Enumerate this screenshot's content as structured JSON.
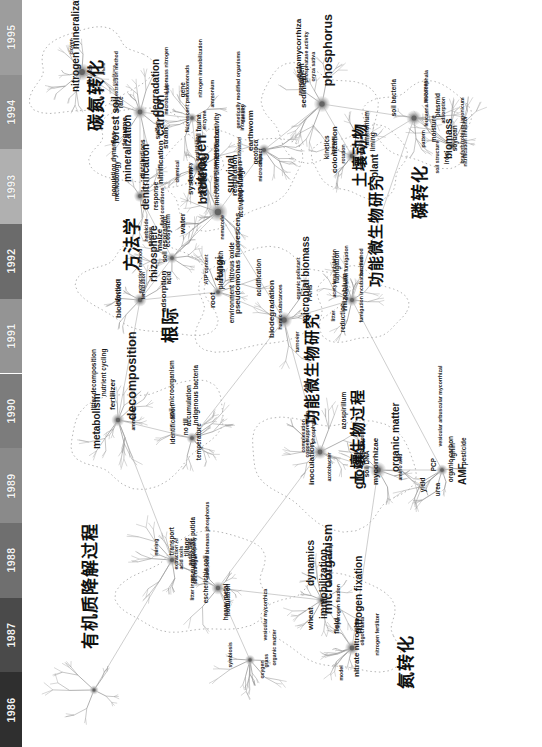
{
  "figure": {
    "type": "co-word-science-map",
    "orientation_deg": -90,
    "background": "#ffffff",
    "edge_color": "#8c8c8c",
    "cluster_outline_color": "#b9b9b9",
    "node_color": "#9a9a9a"
  },
  "timeline": {
    "name": "year-axis",
    "position": "left-edge-vertical",
    "order": "bottom-to-top",
    "years": [
      {
        "label": "1986",
        "shade": "#2f2f2f"
      },
      {
        "label": "1987",
        "shade": "#4a4a4a"
      },
      {
        "label": "1988",
        "shade": "#6f6f6f"
      },
      {
        "label": "1989",
        "shade": "#8a8a8a"
      },
      {
        "label": "1990",
        "shade": "#7c7c7c"
      },
      {
        "label": "1991",
        "shade": "#949494"
      },
      {
        "label": "1992",
        "shade": "#6b6b6b"
      },
      {
        "label": "1993",
        "shade": "#b0b0b0"
      },
      {
        "label": "1994",
        "shade": "#8f8f8f"
      },
      {
        "label": "1995",
        "shade": "#9d9d9d"
      }
    ]
  },
  "clusters": [
    {
      "id": "c-cn",
      "cjk": "碳氮转化",
      "meaning": "carbon-nitrogen transformation"
    },
    {
      "id": "c-meth",
      "cjk": "方法学",
      "meaning": "methodology"
    },
    {
      "id": "c-root",
      "cjk": "根际",
      "meaning": "rhizosphere"
    },
    {
      "id": "c-fauna",
      "cjk": "土壤动物",
      "meaning": "soil fauna"
    },
    {
      "id": "c-p",
      "cjk": "磷转化",
      "meaning": "phosphorus transformation"
    },
    {
      "id": "c-func",
      "cjk": "功能微生物研究",
      "meaning": "functional microorganism research"
    },
    {
      "id": "c-om",
      "cjk": "有机质降解过程",
      "meaning": "organic matter degradation process"
    },
    {
      "id": "c-func2",
      "cjk": "功能微生物研究",
      "meaning": "functional microorganism research"
    },
    {
      "id": "c-sbio",
      "cjk": "土壤生物过程",
      "meaning": "soil biological process"
    },
    {
      "id": "c-n",
      "cjk": "氮转化",
      "meaning": "nitrogen transformation"
    }
  ],
  "keywords": [
    {
      "t": "pH",
      "s": 4
    },
    {
      "t": "nitrogen mineralization",
      "s": 5
    },
    {
      "t": "alfalfa",
      "s": 1
    },
    {
      "t": "ace",
      "s": 2
    },
    {
      "t": "clover",
      "s": 2
    },
    {
      "t": "carbon",
      "s": 6
    },
    {
      "t": "conditions",
      "s": 1
    },
    {
      "t": "legume",
      "s": 4
    },
    {
      "t": "rate",
      "s": 3
    },
    {
      "t": "forest soil",
      "s": 5
    },
    {
      "t": "sulfur",
      "s": 3
    },
    {
      "t": "degradation",
      "s": 5
    },
    {
      "t": "direct extraction method",
      "s": 2
    },
    {
      "t": "soil",
      "s": 2
    },
    {
      "t": "gene",
      "s": 3
    },
    {
      "t": "strain",
      "s": 4
    },
    {
      "t": "enzyme",
      "s": 2
    },
    {
      "t": "microbial biomass nitrogen",
      "s": 2
    },
    {
      "t": "ammonium",
      "s": 2
    },
    {
      "t": "fluorescent pseudomonads",
      "s": 2
    },
    {
      "t": "nitrogen immobilization",
      "s": 2
    },
    {
      "t": "methodology",
      "s": 3
    },
    {
      "t": "denitrification",
      "s": 5
    },
    {
      "t": "population dynamics",
      "s": 3
    },
    {
      "t": "field conditions",
      "s": 2
    },
    {
      "t": "response",
      "s": 3
    },
    {
      "t": "distributions",
      "s": 3
    },
    {
      "t": "nitrification",
      "s": 4
    },
    {
      "t": "mineralization",
      "s": 5
    },
    {
      "t": "nitrogen",
      "s": 7
    },
    {
      "t": "fractionation",
      "s": 2
    },
    {
      "t": "availability",
      "s": 2
    },
    {
      "t": "chemical",
      "s": 2
    },
    {
      "t": "diversity",
      "s": 2
    },
    {
      "t": "soil fauna",
      "s": 3
    },
    {
      "t": "system",
      "s": 4
    },
    {
      "t": "microbial activity",
      "s": 3
    },
    {
      "t": "microbial biomass carbon",
      "s": 3
    },
    {
      "t": "respiration",
      "s": 4
    },
    {
      "t": "activated sludge",
      "s": 3
    },
    {
      "t": "bacteria",
      "s": 6
    },
    {
      "t": "population",
      "s": 4
    },
    {
      "t": "survival",
      "s": 5
    },
    {
      "t": "nematode",
      "s": 2
    },
    {
      "t": "transport processes",
      "s": 2
    },
    {
      "t": "impact",
      "s": 2
    },
    {
      "t": "genetically modified organisms",
      "s": 2
    },
    {
      "t": "cultivation",
      "s": 2
    },
    {
      "t": "density",
      "s": 2
    },
    {
      "t": "earthworm",
      "s": 4
    },
    {
      "t": "geotoca",
      "s": 3
    },
    {
      "t": "interaction",
      "s": 2
    },
    {
      "t": "microcosm",
      "s": 2
    },
    {
      "t": "oryza sativa",
      "s": 2
    },
    {
      "t": "reproduction",
      "s": 2
    },
    {
      "t": "phosphatase activity",
      "s": 2
    },
    {
      "t": "sediment",
      "s": 4
    },
    {
      "t": "ectomycorrhiza",
      "s": 4
    },
    {
      "t": "phosphorus",
      "s": 6
    },
    {
      "t": "nutrient",
      "s": 3
    },
    {
      "t": "calcareous soil",
      "s": 2
    },
    {
      "t": "plant",
      "s": 5
    },
    {
      "t": "humus",
      "s": 2
    },
    {
      "t": "kinetics",
      "s": 3
    },
    {
      "t": "rotation",
      "s": 2
    },
    {
      "t": "colonization",
      "s": 4
    },
    {
      "t": "ammonium",
      "s": 3
    },
    {
      "t": "liming",
      "s": 3
    },
    {
      "t": "pattern",
      "s": 2
    },
    {
      "t": "soil bacteria",
      "s": 3
    },
    {
      "t": "plasmid",
      "s": 3
    },
    {
      "t": "leucaena leucocephala",
      "s": 2
    },
    {
      "t": "enzymes",
      "s": 2
    },
    {
      "t": "moisture",
      "s": 3
    },
    {
      "t": "biomass",
      "s": 5
    },
    {
      "t": "iron",
      "s": 3
    },
    {
      "t": "soil structure",
      "s": 2
    },
    {
      "t": "adsorption",
      "s": 2
    },
    {
      "t": "bradyrhizobium japonicum",
      "s": 2
    },
    {
      "t": "soybean",
      "s": 3
    },
    {
      "t": "nitrification inhibitor",
      "s": 2
    },
    {
      "t": "water",
      "s": 4
    },
    {
      "t": "glucose",
      "s": 2
    },
    {
      "t": "acid",
      "s": 3
    },
    {
      "t": "soil respiration",
      "s": 3
    },
    {
      "t": "ecosystem",
      "s": 3
    },
    {
      "t": "maize",
      "s": 4
    },
    {
      "t": "herbicide",
      "s": 2
    },
    {
      "t": "adsorption",
      "s": 4
    },
    {
      "t": "extraction method",
      "s": 2
    },
    {
      "t": "rhizosphere",
      "s": 5
    },
    {
      "t": "biocontrol",
      "s": 4
    },
    {
      "t": "infection",
      "s": 3
    },
    {
      "t": "fertilization",
      "s": 2
    },
    {
      "t": "nitrous oxide",
      "s": 3
    },
    {
      "t": "root",
      "s": 4
    },
    {
      "t": "ATP content",
      "s": 2
    },
    {
      "t": "environment",
      "s": 3
    },
    {
      "t": "fungi",
      "s": 5
    },
    {
      "t": "pseudomonas fluorescens",
      "s": 4
    },
    {
      "t": "plant growth",
      "s": 3
    },
    {
      "t": "humic substances",
      "s": 2
    },
    {
      "t": "turnover",
      "s": 2
    },
    {
      "t": "PAHs",
      "s": 3
    },
    {
      "t": "organic pollutant",
      "s": 2
    },
    {
      "t": "microbial biomass",
      "s": 5
    },
    {
      "t": "acidification",
      "s": 3
    },
    {
      "t": "biodegradation",
      "s": 4
    },
    {
      "t": "chloroform fumigation",
      "s": 2
    },
    {
      "t": "fumigation",
      "s": 3
    },
    {
      "t": "fumigation incubation method",
      "s": 2
    },
    {
      "t": "bacillus",
      "s": 2
    },
    {
      "t": "litter",
      "s": 2
    },
    {
      "t": "rhizobium",
      "s": 4
    },
    {
      "t": "reduction",
      "s": 3
    },
    {
      "t": "acetylene inhibition",
      "s": 2
    },
    {
      "t": "ammonia",
      "s": 2
    },
    {
      "t": "litter decomposition",
      "s": 3
    },
    {
      "t": "nutrient cycling",
      "s": 3
    },
    {
      "t": "fertilizer",
      "s": 4
    },
    {
      "t": "metabolism",
      "s": 5
    },
    {
      "t": "decomposition",
      "s": 6
    },
    {
      "t": "no till",
      "s": 3
    },
    {
      "t": "temperature",
      "s": 3
    },
    {
      "t": "soil microorganism",
      "s": 3
    },
    {
      "t": "accumulation",
      "s": 3
    },
    {
      "t": "indigenous bacteria",
      "s": 3
    },
    {
      "t": "identification",
      "s": 3
    },
    {
      "t": "azospirillum",
      "s": 3
    },
    {
      "t": "inoculation",
      "s": 4
    },
    {
      "t": "azotobacter",
      "s": 2
    },
    {
      "t": "copper",
      "s": 2
    },
    {
      "t": "phosphatase",
      "s": 2
    },
    {
      "t": "complexation",
      "s": 2
    },
    {
      "t": "suppression",
      "s": 2
    },
    {
      "t": "organic matter",
      "s": 5
    },
    {
      "t": "amino acid",
      "s": 2
    },
    {
      "t": "peptide",
      "s": 2
    },
    {
      "t": "soil DNA",
      "s": 3
    },
    {
      "t": "PCR",
      "s": 3
    },
    {
      "t": "growth",
      "s": 6
    },
    {
      "t": "mycorrhizae",
      "s": 4
    },
    {
      "t": "AMF",
      "s": 5
    },
    {
      "t": "vesicular arbuscular mycorrhizal",
      "s": 2
    },
    {
      "t": "organic carbon",
      "s": 3
    },
    {
      "t": "PCP",
      "s": 3
    },
    {
      "t": "lignin",
      "s": 3
    },
    {
      "t": "urea",
      "s": 3
    },
    {
      "t": "pesticide",
      "s": 3
    },
    {
      "t": "yield",
      "s": 3
    },
    {
      "t": "mining",
      "s": 2
    },
    {
      "t": "transport",
      "s": 3
    },
    {
      "t": "tillage",
      "s": 3
    },
    {
      "t": "acid soils",
      "s": 2
    },
    {
      "t": "extraction Al",
      "s": 2
    },
    {
      "t": "paddy field",
      "s": 2
    },
    {
      "t": "pseudomonas putida",
      "s": 3
    },
    {
      "t": "nodulation",
      "s": 3
    },
    {
      "t": "heavy metal",
      "s": 3
    },
    {
      "t": "escherichia coli",
      "s": 3
    },
    {
      "t": "microbial biomass phosphorus",
      "s": 2
    },
    {
      "t": "soil property",
      "s": 2
    },
    {
      "t": "soil nitrogen",
      "s": 2
    },
    {
      "t": "litter input",
      "s": 2
    },
    {
      "t": "microcalorimetry",
      "s": 2
    },
    {
      "t": "dynamics",
      "s": 5
    },
    {
      "t": "immobilization",
      "s": 5
    },
    {
      "t": "microorganism",
      "s": 6
    },
    {
      "t": "wheat",
      "s": 4
    },
    {
      "t": "field",
      "s": 4
    },
    {
      "t": "nitrate nitrogen",
      "s": 4
    },
    {
      "t": "nitrogen fixation",
      "s": 5
    },
    {
      "t": "oligochaeta",
      "s": 2
    },
    {
      "t": "hydrogen fixation",
      "s": 2
    },
    {
      "t": "nitrogen fertilizer",
      "s": 2
    },
    {
      "t": "model",
      "s": 2
    },
    {
      "t": "grass",
      "s": 2
    },
    {
      "t": "organic matter",
      "s": 2
    },
    {
      "t": "symbiosis",
      "s": 2
    },
    {
      "t": "vesicular mycorrhiza",
      "s": 2
    },
    {
      "t": "oxygen",
      "s": 2
    }
  ]
}
